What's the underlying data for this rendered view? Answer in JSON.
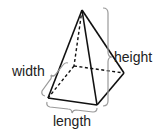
{
  "diagram": {
    "labels": {
      "width": "width",
      "length": "length",
      "height": "height"
    },
    "colors": {
      "edge": "#111111",
      "bracket": "#9a9a9a",
      "text": "#222222",
      "background": "#ffffff"
    }
  }
}
